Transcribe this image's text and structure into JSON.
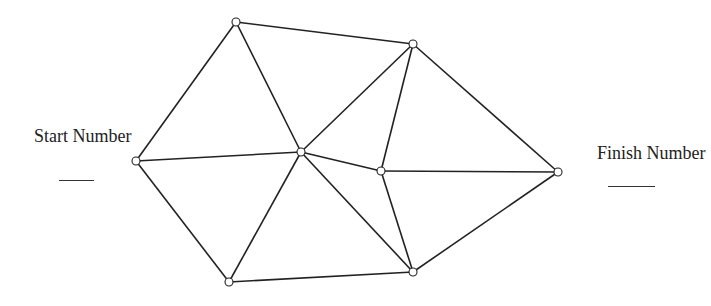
{
  "diagram": {
    "start_label": "Start Number",
    "finish_label": "Finish Number",
    "line_color": "#222222",
    "node_fill": "#ffffff",
    "nodes": [
      {
        "id": "S",
        "x": 136,
        "y": 161
      },
      {
        "id": "A",
        "x": 236,
        "y": 22
      },
      {
        "id": "B",
        "x": 413,
        "y": 44
      },
      {
        "id": "C",
        "x": 301,
        "y": 152
      },
      {
        "id": "D",
        "x": 381,
        "y": 171
      },
      {
        "id": "F",
        "x": 558,
        "y": 172
      },
      {
        "id": "G",
        "x": 229,
        "y": 282
      },
      {
        "id": "H",
        "x": 413,
        "y": 272
      }
    ],
    "edges": [
      [
        "S",
        "A"
      ],
      [
        "S",
        "C"
      ],
      [
        "S",
        "G"
      ],
      [
        "A",
        "B"
      ],
      [
        "A",
        "C"
      ],
      [
        "C",
        "B"
      ],
      [
        "C",
        "G"
      ],
      [
        "C",
        "H"
      ],
      [
        "C",
        "D"
      ],
      [
        "B",
        "D"
      ],
      [
        "B",
        "F"
      ],
      [
        "D",
        "F"
      ],
      [
        "D",
        "H"
      ],
      [
        "G",
        "H"
      ],
      [
        "H",
        "F"
      ]
    ]
  }
}
